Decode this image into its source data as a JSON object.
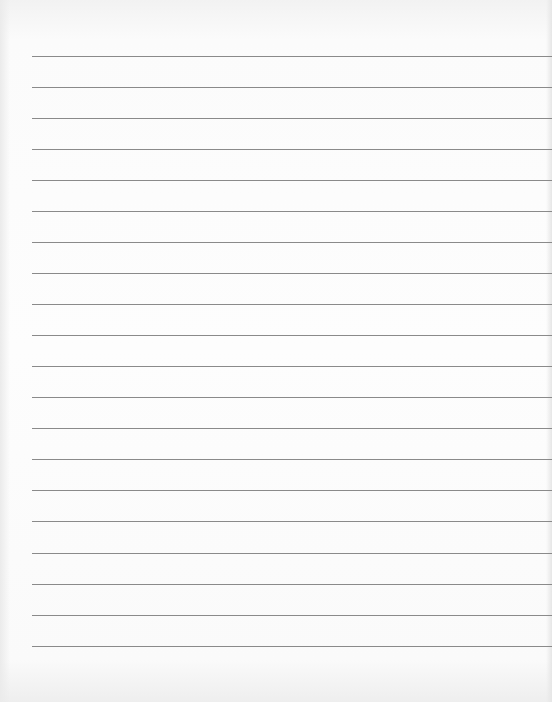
{
  "document": {
    "type": "blank lined paper",
    "rule_count": 20,
    "rule_color": "#8a8a8a",
    "paper_color": "#fbfbfb",
    "rules_y": [
      56,
      87,
      118,
      149,
      180,
      211,
      242,
      273,
      304,
      335,
      366,
      397,
      428,
      459,
      490,
      521,
      553,
      584,
      615,
      646
    ]
  }
}
